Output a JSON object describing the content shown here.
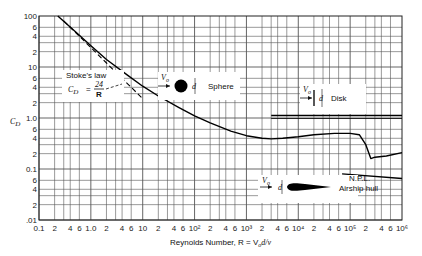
{
  "chart_data": {
    "type": "line",
    "title": "",
    "xlabel": "Reynolds Number, R = V0 d/ν",
    "ylabel": "C_D",
    "xscale": "log",
    "yscale": "log",
    "xlim": [
      0.1,
      1000000
    ],
    "ylim": [
      0.01,
      100
    ],
    "grid": true,
    "x_tick_labels": [
      "0.1",
      "2",
      "4",
      "6",
      "1.0",
      "2",
      "4",
      "6",
      "10",
      "2",
      "4",
      "6",
      "10²",
      "2",
      "4",
      "6",
      "10³",
      "2",
      "4",
      "6",
      "10⁴",
      "2",
      "4",
      "6",
      "10⁵",
      "2",
      "4",
      "6",
      "10⁶"
    ],
    "y_tick_labels": [
      "100",
      "6",
      "4",
      "2",
      "10",
      "6",
      "4",
      "2",
      "1.0",
      "6",
      "4",
      "2",
      "0.1",
      "6",
      "4",
      "2",
      ".01"
    ],
    "series": [
      {
        "name": "Sphere",
        "style": "solid",
        "x": [
          0.23,
          0.5,
          1,
          2,
          5,
          10,
          20,
          50,
          100,
          200,
          500,
          1000,
          2000,
          3000,
          5000,
          10000,
          20000,
          50000,
          100000,
          150000,
          200000,
          250000,
          300000,
          500000,
          1000000
        ],
        "y": [
          100,
          50,
          26,
          14,
          7,
          4.2,
          2.7,
          1.6,
          1.1,
          0.8,
          0.55,
          0.45,
          0.4,
          0.39,
          0.4,
          0.43,
          0.47,
          0.5,
          0.5,
          0.47,
          0.3,
          0.16,
          0.17,
          0.18,
          0.21
        ]
      },
      {
        "name": "Stoke's law C_D = 24/R",
        "style": "dashed",
        "x": [
          0.3,
          1,
          2,
          5,
          10
        ],
        "y": [
          80,
          24,
          12,
          4.8,
          2.4
        ]
      },
      {
        "name": "Disk",
        "style": "solid",
        "x": [
          3000,
          1000000
        ],
        "y": [
          1.12,
          1.12
        ]
      },
      {
        "name": "N.P.L. Airship hull",
        "style": "solid",
        "x": [
          70000,
          1000000
        ],
        "y": [
          0.08,
          0.065
        ]
      }
    ],
    "annotations": [
      {
        "text": "Stoke's law",
        "formula": "C_D = 24/R"
      },
      {
        "text": "Sphere"
      },
      {
        "text": "Disk"
      },
      {
        "text": "N.P.L. Airship hull"
      }
    ]
  },
  "labels": {
    "y_axis": "C",
    "y_axis_sub": "D",
    "x_axis": "Reynolds Number, R = V",
    "x_axis_tail": "d/ν",
    "stokes_title": "Stoke's law",
    "stokes_lhs": "C",
    "stokes_sub": "D",
    "stokes_eq": "=",
    "stokes_num": "24",
    "stokes_den": "R",
    "sphere": "Sphere",
    "disk": "Disk",
    "airship_1": "N.P.L.",
    "airship_2": "Airship hull",
    "v0": "V",
    "v0_sub": "o",
    "d": "d"
  }
}
